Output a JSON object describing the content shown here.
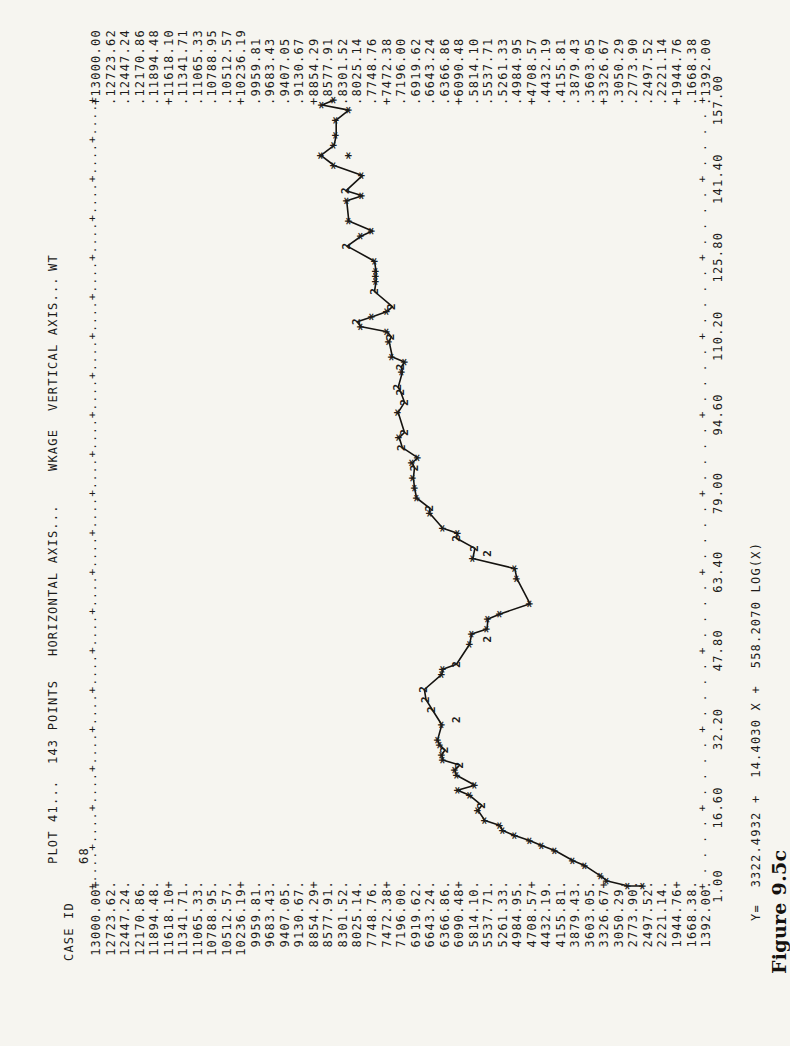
{
  "page": {
    "paper_color": "#f6f5f0",
    "ink_color": "#1d1c1a"
  },
  "header": {
    "plot": "PLOT 41...",
    "points": "143 POINTS",
    "horizontal_axis": "HORIZONTAL AXIS...",
    "x_var": "WKAGE",
    "vertical_axis": "VERTICAL AXIS...",
    "y_var": "WT",
    "case_id_label": "CASE ID",
    "case_id_value": "68"
  },
  "equation": "Y=  3322.4932 +  14.4030 X +  558.2070 LOG(X)",
  "caption": "Figure 9.5c",
  "chart_data": {
    "type": "scatter",
    "title": "PLOT 41...  143 POINTS",
    "xlabel": "WKAGE",
    "ylabel": "WT",
    "xlim": [
      1.0,
      157.0
    ],
    "ylim": [
      1392.0,
      13000.0
    ],
    "grid": false,
    "marker_note": "* = one point, 2 = two coincident points",
    "fit_equation": "Y= 3322.4932 + 14.4030 X + 558.2070 LOG(X)",
    "x_ticks": [
      "1.00",
      "16.60",
      "32.20",
      "47.80",
      "63.40",
      "79.00",
      "94.60",
      "110.20",
      "125.80",
      "141.40",
      "157.00"
    ],
    "y_ticks": [
      "13000.00",
      "12723.62",
      "12447.24",
      "12170.86",
      "11894.48",
      "11618.10",
      "11341.71",
      "11065.33",
      "10788.95",
      "10512.57",
      "10236.19",
      "9959.81",
      "9683.43",
      "9407.05",
      "9130.67",
      "8854.29",
      "8577.91",
      "8301.52",
      "8025.14",
      "7748.76",
      "7472.38",
      "7196.00",
      "6919.62",
      "6643.24",
      "6366.86",
      "6090.48",
      "5814.10",
      "5537.71",
      "5261.33",
      "4984.95",
      "4708.57",
      "4432.19",
      "4155.81",
      "3879.43",
      "3603.05",
      "3326.67",
      "3050.29",
      "2773.90",
      "2497.52",
      "2221.14",
      "1944.76",
      "1668.38",
      "1392.00"
    ],
    "points": [
      [
        1,
        2600,
        "*",
        0
      ],
      [
        1,
        2870,
        "*",
        0
      ],
      [
        2,
        3270,
        "*",
        0
      ],
      [
        3,
        3400,
        "*",
        0
      ],
      [
        5,
        3690,
        "*",
        0
      ],
      [
        6,
        3920,
        "*",
        0
      ],
      [
        8,
        4260,
        "*",
        0
      ],
      [
        9,
        4510,
        "*",
        0
      ],
      [
        10,
        4740,
        "*",
        0
      ],
      [
        11,
        5030,
        "*",
        0
      ],
      [
        12,
        5260,
        "*",
        0
      ],
      [
        13,
        5310,
        "*",
        0
      ],
      [
        14,
        5600,
        "*",
        0
      ],
      [
        16,
        5730,
        "*",
        0
      ],
      [
        17,
        5660,
        "2",
        0
      ],
      [
        19,
        5890,
        "*",
        0
      ],
      [
        20,
        6120,
        "*",
        0
      ],
      [
        21,
        5790,
        "*",
        0
      ],
      [
        23,
        6140,
        "*",
        0
      ],
      [
        24,
        6170,
        "*",
        0
      ],
      [
        25,
        6080,
        "2",
        0
      ],
      [
        26,
        6400,
        "*",
        0
      ],
      [
        27,
        6420,
        "*",
        0
      ],
      [
        28,
        6360,
        "2",
        0
      ],
      [
        29,
        6460,
        "*",
        0
      ],
      [
        30,
        6500,
        "*",
        0
      ],
      [
        33,
        6420,
        "*",
        0
      ],
      [
        34,
        6130,
        "2",
        1
      ],
      [
        36,
        6600,
        "2",
        0
      ],
      [
        38,
        6720,
        "2",
        0
      ],
      [
        40,
        6750,
        "2",
        0
      ],
      [
        43,
        6420,
        "*",
        0
      ],
      [
        44,
        6400,
        "*",
        0
      ],
      [
        45,
        6140,
        "2",
        0
      ],
      [
        49,
        5890,
        "*",
        0
      ],
      [
        50,
        5540,
        "2",
        1
      ],
      [
        51,
        5850,
        "*",
        0
      ],
      [
        52,
        5560,
        "*",
        0
      ],
      [
        54,
        5540,
        "*",
        0
      ],
      [
        55,
        5310,
        "*",
        0
      ],
      [
        57,
        4740,
        "*",
        0
      ],
      [
        62,
        4990,
        "*",
        0
      ],
      [
        64,
        5030,
        "*",
        0
      ],
      [
        66,
        5830,
        "*",
        0
      ],
      [
        67,
        5540,
        "2",
        1
      ],
      [
        68,
        5790,
        "2",
        0
      ],
      [
        70,
        6140,
        "2",
        0
      ],
      [
        71,
        6120,
        "*",
        0
      ],
      [
        72,
        6400,
        "*",
        0
      ],
      [
        75,
        6650,
        "*",
        0
      ],
      [
        76,
        6650,
        "2",
        0
      ],
      [
        78,
        6900,
        "*",
        0
      ],
      [
        80,
        6940,
        "*",
        0
      ],
      [
        82,
        6960,
        "*",
        0
      ],
      [
        84,
        6940,
        "2",
        0
      ],
      [
        85,
        6980,
        "*",
        0
      ],
      [
        86,
        6880,
        "*",
        0
      ],
      [
        88,
        7170,
        "2",
        0
      ],
      [
        90,
        7230,
        "*",
        0
      ],
      [
        91,
        7130,
        "2",
        0
      ],
      [
        95,
        7250,
        "*",
        0
      ],
      [
        97,
        7130,
        "2",
        0
      ],
      [
        99,
        7200,
        "2",
        0
      ],
      [
        100,
        7250,
        "2",
        0
      ],
      [
        103,
        7170,
        "*",
        0
      ],
      [
        104,
        7190,
        "2",
        0
      ],
      [
        105,
        7130,
        "*",
        0
      ],
      [
        106,
        7360,
        "*",
        0
      ],
      [
        109,
        7420,
        "*",
        0
      ],
      [
        110,
        7380,
        "2",
        0
      ],
      [
        111,
        7460,
        "*",
        0
      ],
      [
        112,
        7950,
        "*",
        0
      ],
      [
        113,
        8030,
        "2",
        0
      ],
      [
        114,
        7740,
        "*",
        0
      ],
      [
        115,
        7460,
        "*",
        0
      ],
      [
        116,
        7360,
        "2",
        0
      ],
      [
        119,
        7700,
        "2",
        0
      ],
      [
        121,
        7670,
        "*",
        0
      ],
      [
        122,
        7670,
        "*",
        0
      ],
      [
        123,
        7670,
        "*",
        0
      ],
      [
        125,
        7700,
        "*",
        0
      ],
      [
        128,
        8220,
        "2",
        0
      ],
      [
        130,
        7950,
        "*",
        0
      ],
      [
        131,
        7740,
        "*",
        0
      ],
      [
        133,
        8190,
        "*",
        0
      ],
      [
        137,
        8230,
        "*",
        0
      ],
      [
        138,
        7930,
        "*",
        0
      ],
      [
        139,
        8240,
        "2",
        0
      ],
      [
        142,
        7930,
        "*",
        0
      ],
      [
        144,
        8470,
        "*",
        0
      ],
      [
        146,
        8190,
        "*",
        1
      ],
      [
        146,
        8720,
        "*",
        0
      ],
      [
        148,
        8470,
        "*",
        0
      ],
      [
        150,
        8430,
        "*",
        0
      ],
      [
        153,
        8430,
        "*",
        0
      ],
      [
        155,
        8190,
        "*",
        0
      ],
      [
        156,
        8700,
        "*",
        0
      ],
      [
        157,
        8470,
        "*",
        0
      ]
    ]
  }
}
